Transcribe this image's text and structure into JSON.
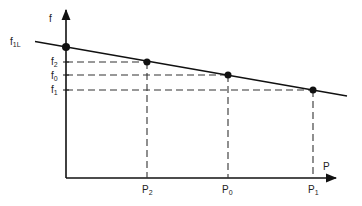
{
  "axes": {
    "y_label": "f",
    "x_label": "P"
  },
  "y_ticks": [
    {
      "main": "f",
      "sub": "1L",
      "y": 42
    },
    {
      "main": "f",
      "sub": "2",
      "y": 62
    },
    {
      "main": "f",
      "sub": "0",
      "y": 75
    },
    {
      "main": "f",
      "sub": "1",
      "y": 90
    }
  ],
  "x_ticks": [
    {
      "main": "P",
      "sub": "2",
      "x": 147
    },
    {
      "main": "P",
      "sub": "0",
      "x": 228
    },
    {
      "main": "P",
      "sub": "1",
      "x": 313
    }
  ],
  "points": [
    {
      "name": "f1L-intercept",
      "x": 66,
      "y": 47
    },
    {
      "name": "P2-f2",
      "x": 147,
      "y": 62
    },
    {
      "name": "P0-f0",
      "x": 228,
      "y": 75
    },
    {
      "name": "P1-f1",
      "x": 313,
      "y": 90
    }
  ],
  "colors": {
    "ink": "#111111",
    "dash": "#333333"
  }
}
